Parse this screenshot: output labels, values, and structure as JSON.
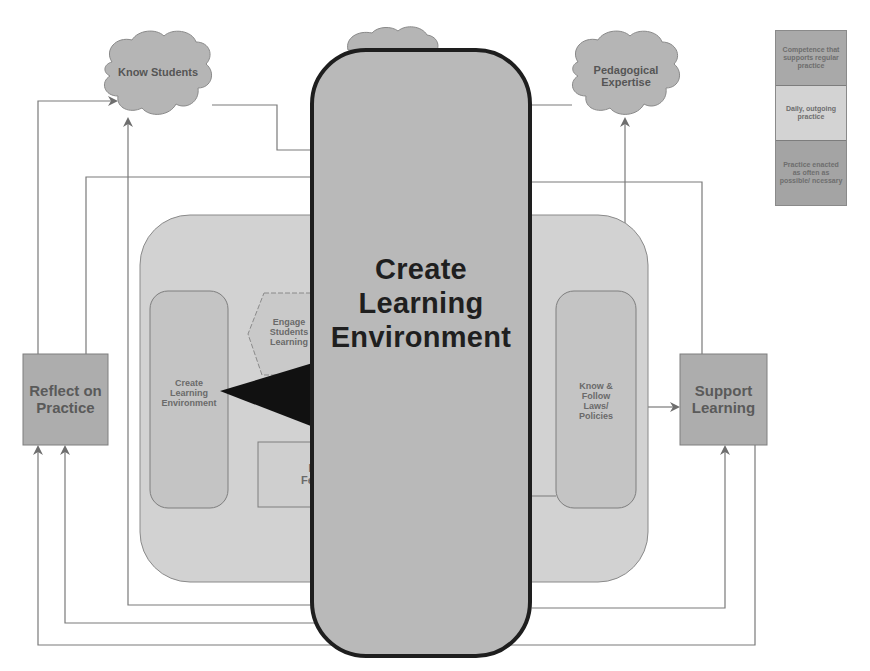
{
  "diagram": {
    "clouds": {
      "know_students": "Know Students",
      "pedagogical_expertise_line1": "Pedagogical",
      "pedagogical_expertise_line2": "Expertise"
    },
    "outer_boxes": {
      "reflect_on_practice_line1": "Reflect on",
      "reflect_on_practice_line2": "Practice",
      "support_learning_line1": "Support",
      "support_learning_line2": "Learning"
    },
    "inner_items": {
      "create_learning_environment_line1": "Create",
      "create_learning_environment_line2": "Learning",
      "create_learning_environment_line3": "Environment",
      "engage_students_line1": "Engage",
      "engage_students_line2": "Students",
      "engage_students_line3": "Learning",
      "provide_feedback_line1": "Pr",
      "provide_feedback_line2": "Fee",
      "know_follow_line1": "Know &",
      "know_follow_line2": "Follow",
      "know_follow_line3": "Laws/",
      "know_follow_line4": "Policies"
    },
    "overlay": {
      "line1": "Create",
      "line2": "Learning",
      "line3": "Environment"
    },
    "legend": [
      {
        "label": "Competence that supports regular practice",
        "color": "#a9a9a9"
      },
      {
        "label": "Daily, outgoing practice",
        "color": "#d3d3d3"
      },
      {
        "label": "Practice enacted as often as possible/ ncessary",
        "color": "#a4a4a4"
      }
    ],
    "colors": {
      "cloud_fill": "#b5b5b5",
      "outer_box_fill": "#adadad",
      "container_fill": "#d2d2d2",
      "inner_fill": "#c4c4c4",
      "overlay_fill": "#b9b9b9",
      "overlay_border": "#1e1e1e",
      "line": "#7a7a7a"
    }
  }
}
